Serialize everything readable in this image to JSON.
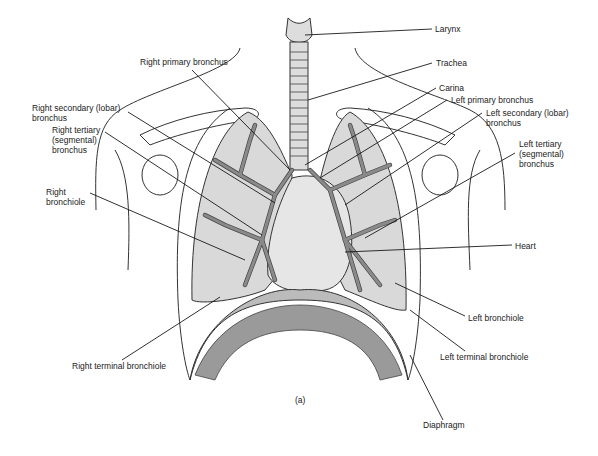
{
  "figure": {
    "caption": "(a)",
    "labels": {
      "larynx": "Larynx",
      "trachea": "Trachea",
      "carina": "Carina",
      "right_primary_bronchus": "Right primary bronchus",
      "left_primary_bronchus": "Left primary bronchus",
      "right_secondary_bronchus": "Right secondary (lobar)\nbronchus",
      "left_secondary_bronchus": "Left secondary (lobar)\nbronchus",
      "right_tertiary_bronchus": "Right tertiary\n(segmental)\nbronchus",
      "left_tertiary_bronchus": "Left tertiary\n(segmental)\nbronchus",
      "right_bronchiole": "Right\nbronchiole",
      "heart": "Heart",
      "left_bronchiole": "Left bronchiole",
      "right_terminal_bronchiole": "Right terminal bronchiole",
      "left_terminal_bronchiole": "Left terminal bronchiole",
      "diaphragm": "Diaphragm"
    }
  }
}
